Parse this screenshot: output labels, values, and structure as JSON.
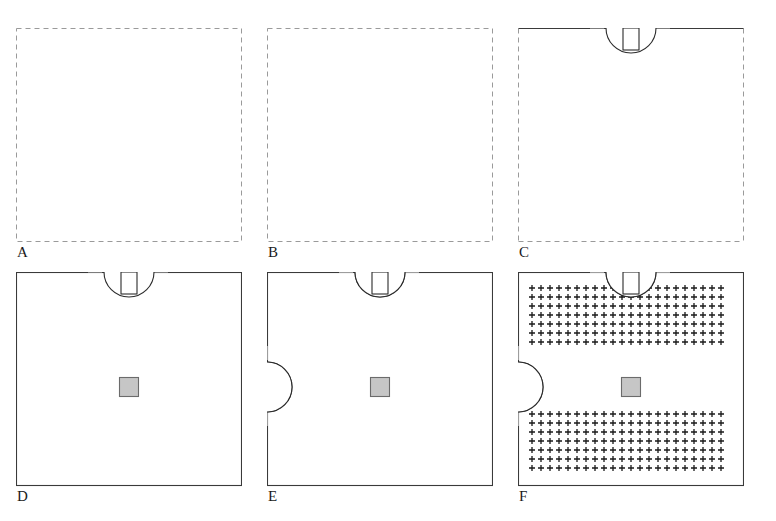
{
  "figure": {
    "panel_count": 6,
    "rows": 2,
    "columns": 3,
    "background_color": "#ffffff"
  },
  "style": {
    "outline_color": "#2b2b2b",
    "outline_width": 1.1,
    "dashed_border_color": "#9a9a9a",
    "solid_border_color": "#3a3a3a",
    "centerline_color": "#bdbdbd",
    "center_square_fill": "#a8a8a8",
    "center_square_stroke": "#6b6b6b",
    "hatch_mark_color": "#1a1a1a",
    "label_color": "#1a1a1a"
  },
  "geometry": {
    "panel_width": 226,
    "panel_height": 214,
    "cross": {
      "core_size": 86,
      "tab_width": 30,
      "tab_depth": 16
    },
    "circle_radius": 25,
    "stem": {
      "width": 16,
      "height": 22
    },
    "center_square_size": 19,
    "hatch_spacing": 9,
    "hatch_mark_size": 3
  },
  "panels": [
    {
      "id": "A",
      "label": "A",
      "caption": "Base square outline inside construction boundary",
      "border_style": "dashed",
      "features": {
        "square": true,
        "tabs": false,
        "centerlines": false,
        "top_circle": false,
        "side_circles": false,
        "center_square": false,
        "hatching": false
      },
      "x": 16,
      "y": 28
    },
    {
      "id": "B",
      "label": "B",
      "caption": "Four side tabs and centerlines added",
      "border_style": "dashed",
      "features": {
        "square": true,
        "tabs": true,
        "centerlines": true,
        "top_circle": false,
        "side_circles": false,
        "center_square": false,
        "hatching": false
      },
      "x": 267,
      "y": 28
    },
    {
      "id": "C",
      "label": "C",
      "caption": "Top boss circle and stem added; top border becomes solid",
      "border_style": "dashed-open-top",
      "features": {
        "square": true,
        "tabs": true,
        "centerlines": true,
        "top_circle": true,
        "side_circles": false,
        "center_square": false,
        "hatching": false
      },
      "x": 518,
      "y": 28
    },
    {
      "id": "D",
      "label": "D",
      "caption": "Border fully solid; central filled bore square added",
      "border_style": "solid",
      "features": {
        "square": true,
        "tabs": true,
        "centerlines": true,
        "top_circle": true,
        "side_circles": false,
        "center_square": true,
        "hatching": false
      },
      "x": 16,
      "y": 272
    },
    {
      "id": "E",
      "label": "E",
      "caption": "Left, right and bottom boss circles added with crosshairs",
      "border_style": "solid",
      "features": {
        "square": true,
        "tabs": true,
        "centerlines": true,
        "top_circle": true,
        "side_circles": true,
        "center_square": true,
        "hatching": false
      },
      "x": 267,
      "y": 272
    },
    {
      "id": "F",
      "label": "F",
      "caption": "Section hatching pattern applied to upper and lower fields",
      "border_style": "solid",
      "features": {
        "square": true,
        "tabs": true,
        "centerlines": true,
        "top_circle": true,
        "side_circles": true,
        "center_square": true,
        "hatching": true
      },
      "x": 518,
      "y": 272
    }
  ]
}
